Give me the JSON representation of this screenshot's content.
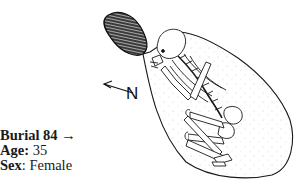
{
  "figure": {
    "north_label": "N",
    "icons": [
      "north-arrow-icon",
      "burial-pit-outline",
      "skeleton-drawing",
      "hatched-stone-object"
    ],
    "colors": {
      "ink": "#111111",
      "background": "#ffffff"
    }
  },
  "caption": {
    "burial_label": "Burial 84",
    "burial_arrow": " →",
    "age_label": "Age:",
    "age_value": " 35",
    "sex_label": "Sex",
    "sex_value": ": Female"
  }
}
